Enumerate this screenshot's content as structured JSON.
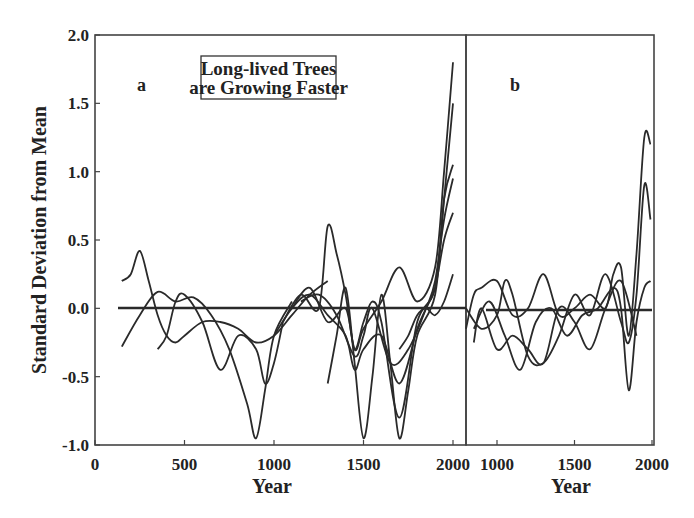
{
  "chart_data": [
    {
      "panel": "a",
      "type": "line",
      "title": "Long-lived Trees are Growing Faster",
      "panel_label": "a",
      "xlabel": "Year",
      "ylabel": "Standard Deviation from Mean",
      "xlim": [
        0,
        2080
      ],
      "ylim": [
        -1.0,
        2.0
      ],
      "xticks": [
        0,
        500,
        1000,
        1500,
        2000
      ],
      "xtick_labels": [
        "0",
        "500",
        "1000",
        "1500",
        "2000"
      ],
      "yticks": [
        -1.0,
        -0.5,
        0.0,
        0.5,
        1.0,
        1.5,
        2.0
      ],
      "ytick_labels": [
        "-1.0",
        "-0.5",
        "0.0",
        "0.5",
        "1.0",
        "1.5",
        "2.0"
      ],
      "grid": false,
      "reference_line": 0.0,
      "series": [
        {
          "name": "tree-1",
          "x": [
            150,
            200,
            250,
            300,
            350,
            400,
            450,
            500,
            600,
            700,
            800,
            900,
            1000,
            1100,
            1200,
            1300
          ],
          "values": [
            0.2,
            0.25,
            0.42,
            0.2,
            -0.05,
            -0.2,
            -0.25,
            -0.2,
            -0.1,
            -0.1,
            -0.15,
            -0.25,
            -0.2,
            -0.05,
            0.1,
            0.2
          ]
        },
        {
          "name": "tree-2",
          "x": [
            150,
            250,
            350,
            450,
            550,
            650,
            750,
            850,
            900,
            950,
            1000,
            1100
          ],
          "values": [
            -0.28,
            -0.05,
            0.12,
            0.05,
            0.08,
            -0.05,
            -0.3,
            -0.7,
            -0.95,
            -0.6,
            -0.2,
            0.05
          ]
        },
        {
          "name": "tree-3",
          "x": [
            350,
            400,
            450,
            500,
            600,
            700,
            800,
            900,
            950,
            1000,
            1050
          ],
          "values": [
            -0.3,
            -0.2,
            0.05,
            0.1,
            -0.1,
            -0.45,
            -0.2,
            -0.3,
            -0.55,
            -0.4,
            -0.1
          ]
        },
        {
          "name": "tree-4",
          "x": [
            1050,
            1150,
            1250,
            1300,
            1350,
            1400,
            1450,
            1500,
            1600,
            1700,
            1800,
            1900,
            1950,
            2000
          ],
          "values": [
            -0.1,
            0.1,
            0.0,
            0.6,
            0.4,
            0.1,
            -0.3,
            -0.15,
            0.05,
            0.3,
            0.05,
            0.3,
            1.0,
            1.8
          ]
        },
        {
          "name": "tree-5",
          "x": [
            1300,
            1350,
            1400,
            1450,
            1500,
            1550,
            1600,
            1650,
            1700,
            1750,
            1800,
            1900,
            1950,
            2000
          ],
          "values": [
            -0.55,
            -0.2,
            0.15,
            -0.4,
            -0.95,
            -0.5,
            0.1,
            -0.4,
            -0.95,
            -0.6,
            -0.2,
            0.1,
            0.8,
            1.5
          ]
        },
        {
          "name": "tree-6",
          "x": [
            1100,
            1200,
            1300,
            1400,
            1450,
            1500,
            1550,
            1600,
            1700,
            1800,
            1900,
            1950,
            2000
          ],
          "values": [
            0.0,
            0.15,
            -0.1,
            0.0,
            -0.3,
            -0.1,
            0.05,
            -0.1,
            -0.8,
            -0.1,
            0.15,
            0.8,
            1.05
          ]
        },
        {
          "name": "tree-7",
          "x": [
            1150,
            1250,
            1350,
            1450,
            1500,
            1550,
            1650,
            1750,
            1850,
            1900,
            1950,
            2000
          ],
          "values": [
            0.05,
            0.1,
            -0.05,
            -0.35,
            -0.2,
            0.0,
            -0.4,
            -0.3,
            0.0,
            0.2,
            0.65,
            0.95
          ]
        },
        {
          "name": "tree-8",
          "x": [
            1000,
            1100,
            1200,
            1300,
            1400,
            1450,
            1500,
            1600,
            1700,
            1800,
            1850,
            1900,
            1950,
            2000
          ],
          "values": [
            -0.2,
            0.0,
            0.1,
            -0.05,
            -0.2,
            -0.45,
            -0.3,
            -0.2,
            -0.55,
            -0.15,
            0.0,
            0.15,
            0.5,
            0.7
          ]
        },
        {
          "name": "tree-9",
          "x": [
            1700,
            1750,
            1800,
            1850,
            1900,
            1950,
            2000
          ],
          "values": [
            -0.3,
            -0.2,
            -0.05,
            0.0,
            -0.05,
            0.05,
            0.25
          ]
        }
      ]
    },
    {
      "panel": "b",
      "type": "line",
      "panel_label": "b",
      "xlabel": "Year",
      "ylabel": "Standard Deviation from Mean",
      "xlim": [
        800,
        2010
      ],
      "ylim": [
        -1.0,
        2.0
      ],
      "xticks": [
        1000,
        1500,
        2000
      ],
      "xtick_labels": [
        "1000",
        "1500",
        "2000"
      ],
      "grid": false,
      "reference_line": 0.0,
      "series": [
        {
          "name": "tree-b1",
          "x": [
            800,
            850,
            900,
            1000,
            1100,
            1200,
            1300,
            1400,
            1500,
            1600,
            1700,
            1750,
            1800,
            1850,
            1900,
            1950,
            1990
          ],
          "values": [
            -0.15,
            0.1,
            0.15,
            0.2,
            -0.05,
            0.0,
            0.25,
            -0.05,
            0.0,
            0.1,
            0.0,
            0.25,
            0.3,
            -0.2,
            0.4,
            1.25,
            1.2
          ]
        },
        {
          "name": "tree-b2",
          "x": [
            800,
            900,
            1000,
            1050,
            1100,
            1200,
            1300,
            1400,
            1500,
            1600,
            1700,
            1800,
            1850,
            1900,
            1950,
            1990
          ],
          "values": [
            0.0,
            -0.15,
            -0.05,
            0.2,
            0.1,
            -0.35,
            -0.4,
            -0.2,
            0.1,
            -0.05,
            0.25,
            -0.1,
            -0.25,
            0.1,
            0.9,
            0.65
          ]
        },
        {
          "name": "tree-b3",
          "x": [
            850,
            950,
            1050,
            1150,
            1250,
            1350,
            1450,
            1550,
            1650,
            1750,
            1800,
            1850,
            1900,
            1950,
            1990
          ],
          "values": [
            -0.15,
            0.05,
            -0.2,
            -0.45,
            -0.1,
            0.0,
            -0.2,
            -0.05,
            0.0,
            0.15,
            0.0,
            -0.6,
            -0.1,
            0.15,
            0.2
          ]
        },
        {
          "name": "tree-b4",
          "x": [
            850,
            900,
            1000,
            1100,
            1200,
            1300,
            1400,
            1500,
            1600,
            1700,
            1800,
            1900
          ],
          "values": [
            -0.25,
            0.0,
            -0.3,
            -0.2,
            -0.3,
            -0.4,
            0.0,
            -0.1,
            -0.3,
            0.0,
            0.2,
            -0.2
          ]
        }
      ]
    }
  ],
  "labels": {
    "title_line1": "Long-lived Trees",
    "title_line2": "are Growing Faster",
    "panel_a": "a",
    "panel_b": "b",
    "ylabel": "Standard Deviation from Mean",
    "xlabel_a": "Year",
    "xlabel_b": "Year"
  },
  "colors": {
    "line": "#2a2a2a",
    "axis": "#444444",
    "background": "#ffffff"
  }
}
